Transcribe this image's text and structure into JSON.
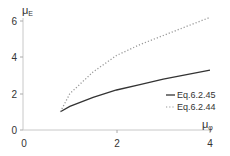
{
  "chart_data": {
    "type": "line",
    "title": "",
    "xlabel": "μφ",
    "ylabel": "μE",
    "xlabel_main": "μ",
    "xlabel_sub": "φ",
    "ylabel_main": "μ",
    "ylabel_sub": "E",
    "xlim": [
      0,
      4
    ],
    "ylim": [
      0,
      6
    ],
    "xticks": [
      0,
      2,
      4
    ],
    "yticks": [
      0,
      2,
      4,
      6
    ],
    "grid": false,
    "legend_position": "right-middle",
    "series": [
      {
        "name": "Eq.6.2.45",
        "style": "solid",
        "color": "#333333",
        "x": [
          0.8,
          1.0,
          1.5,
          2.0,
          2.5,
          3.0,
          3.5,
          4.0
        ],
        "y": [
          1.0,
          1.3,
          1.8,
          2.2,
          2.5,
          2.8,
          3.05,
          3.3
        ]
      },
      {
        "name": "Eq.6.2.44",
        "style": "dotted",
        "color": "#999999",
        "x": [
          0.8,
          1.0,
          1.5,
          2.0,
          2.5,
          3.0,
          3.5,
          4.0
        ],
        "y": [
          1.0,
          2.0,
          3.2,
          4.1,
          4.7,
          5.2,
          5.7,
          6.2
        ]
      }
    ]
  },
  "labels": {
    "xticks": [
      "0",
      "2",
      "4"
    ],
    "yticks": [
      "0",
      "2",
      "4",
      "6"
    ],
    "legend": [
      "Eq.6.2.45",
      "Eq.6.2.44"
    ]
  }
}
